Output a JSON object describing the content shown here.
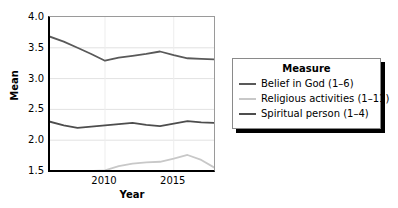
{
  "chart_data": {
    "type": "line",
    "title": "",
    "xlabel": "Year",
    "ylabel": "Mean",
    "xlim": [
      2006,
      2018
    ],
    "ylim": [
      1.5,
      4.0
    ],
    "yticks": [
      "4.0",
      "3.5",
      "3.0",
      "2.5",
      "2.0",
      "1.5"
    ],
    "ytick_values": [
      4.0,
      3.5,
      3.0,
      2.5,
      2.0,
      1.5
    ],
    "xticks": [
      "2010",
      "2015"
    ],
    "xtick_values": [
      2010,
      2015
    ],
    "grid": "horizontal-and-vertical-light",
    "legend_position": "right-outside",
    "legend_title": "Measure",
    "x": [
      2006,
      2007,
      2008,
      2009,
      2010,
      2011,
      2012,
      2013,
      2014,
      2015,
      2016,
      2017,
      2018
    ],
    "series": [
      {
        "name": "Belief in God (1–6)",
        "color": "#595959",
        "values": [
          3.68,
          3.6,
          3.5,
          3.4,
          3.29,
          3.34,
          3.37,
          3.4,
          3.44,
          3.38,
          3.33,
          3.32,
          3.31
        ]
      },
      {
        "name": "Religious activities (1–11)",
        "color": "#c8c8c8",
        "values": [
          1.5,
          1.5,
          1.5,
          1.5,
          1.51,
          1.58,
          1.62,
          1.64,
          1.65,
          1.7,
          1.76,
          1.68,
          1.55
        ]
      },
      {
        "name": "Spiritual person (1–4)",
        "color": "#4d4d4d",
        "values": [
          2.3,
          2.24,
          2.2,
          2.22,
          2.24,
          2.26,
          2.28,
          2.25,
          2.23,
          2.27,
          2.31,
          2.29,
          2.28
        ]
      }
    ]
  },
  "legend": {
    "title": "Measure",
    "items": [
      {
        "label": "Belief in God (1–6)",
        "color": "#595959"
      },
      {
        "label": "Religious activities (1–11)",
        "color": "#c8c8c8"
      },
      {
        "label": "Spiritual person (1–4)",
        "color": "#4d4d4d"
      }
    ]
  }
}
